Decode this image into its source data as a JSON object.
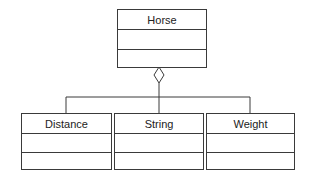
{
  "diagram": {
    "type": "uml-class-aggregation",
    "parent": {
      "name": "Horse",
      "attributes": [],
      "operations": []
    },
    "relationship": "aggregation",
    "children": [
      {
        "name": "Distance",
        "attributes": [],
        "operations": []
      },
      {
        "name": "String",
        "attributes": [],
        "operations": []
      },
      {
        "name": "Weight",
        "attributes": [],
        "operations": []
      }
    ]
  },
  "colors": {
    "line": "#3a3a3a",
    "background": "#ffffff",
    "text": "#222222"
  }
}
